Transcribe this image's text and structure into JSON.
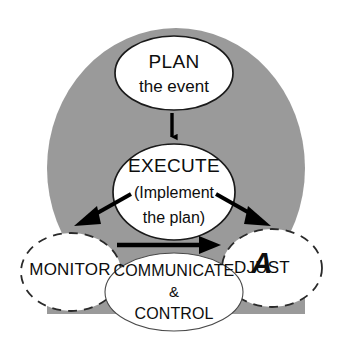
{
  "diagram": {
    "background_color": "#ffffff",
    "backdrop": {
      "name": "gray-circle-backdrop",
      "color": "#9a9a9a"
    },
    "nodes": [
      {
        "id": "plan",
        "name": "plan-node",
        "lines": [
          "PLAN",
          "the event"
        ],
        "border_style": "solid",
        "fill": "#ffffff",
        "stroke": "#1a1a1a"
      },
      {
        "id": "execute",
        "name": "execute-node",
        "lines": [
          "EXECUTE",
          "(Implement",
          "the plan)"
        ],
        "border_style": "solid",
        "fill": "#ffffff",
        "stroke": "#1a1a1a"
      },
      {
        "id": "monitor",
        "name": "monitor-node",
        "lines": [
          "MONITOR"
        ],
        "border_style": "dashed",
        "fill": "#ffffff",
        "stroke": "#2a2a2a"
      },
      {
        "id": "adjust",
        "name": "adjust-node",
        "lines": [
          "ADJUST"
        ],
        "initial": "A",
        "remainder": "DJUST",
        "border_style": "dashed",
        "fill": "#ffffff",
        "stroke": "#2a2a2a"
      },
      {
        "id": "communicate_control",
        "name": "communicate-and-control-node",
        "lines": [
          "COMMUNICATE",
          "&",
          "CONTROL"
        ],
        "border_style": "solid-thin",
        "fill": "#ffffff",
        "stroke": "#4a4a4a"
      }
    ],
    "arrows": [
      {
        "id": "plan_to_execute",
        "name": "arrow-plan-to-execute",
        "from": "plan",
        "to": "execute",
        "direction": "down",
        "color": "#000000"
      },
      {
        "id": "execute_to_monitor",
        "name": "arrow-execute-to-monitor",
        "from": "execute",
        "to": "monitor",
        "direction": "down-left",
        "color": "#000000"
      },
      {
        "id": "execute_to_adjust",
        "name": "arrow-execute-to-adjust",
        "from": "execute",
        "to": "adjust",
        "direction": "down-right",
        "color": "#000000"
      },
      {
        "id": "monitor_to_adjust",
        "name": "arrow-monitor-to-adjust",
        "from": "monitor",
        "to": "adjust",
        "direction": "right",
        "color": "#000000"
      }
    ]
  }
}
